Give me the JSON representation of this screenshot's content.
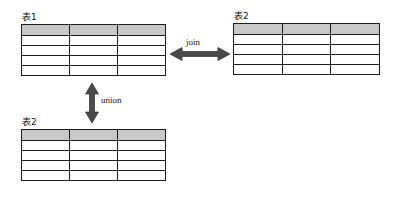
{
  "diagram": {
    "background_color": "#ffffff",
    "line_color": "#1c1c1c",
    "header_fill_color": "#c9c9c9",
    "arrow_color": "#4a4a4a"
  },
  "tables": [
    {
      "id": "table-1",
      "label": "表1",
      "columns": 3,
      "header_rows": 1,
      "body_rows": 4,
      "total_rows": 5,
      "header_filled": true
    },
    {
      "id": "table-2-right",
      "label": "表2",
      "columns": 3,
      "header_rows": 1,
      "body_rows": 4,
      "total_rows": 5,
      "header_filled": true
    },
    {
      "id": "table-2-bottom",
      "label": "表2",
      "columns": 3,
      "header_rows": 1,
      "body_rows": 4,
      "total_rows": 5,
      "header_filled": true
    }
  ],
  "connectors": [
    {
      "id": "join-connector",
      "label": "join",
      "orientation": "horizontal",
      "arrowheads": "both",
      "from": "table-1",
      "to": "table-2-right"
    },
    {
      "id": "union-connector",
      "label": "union",
      "orientation": "vertical",
      "arrowheads": "both",
      "from": "table-1",
      "to": "table-2-bottom"
    }
  ],
  "icons": {
    "double_arrow_horizontal": "double-arrow-horizontal-icon",
    "double_arrow_vertical": "double-arrow-vertical-icon"
  }
}
